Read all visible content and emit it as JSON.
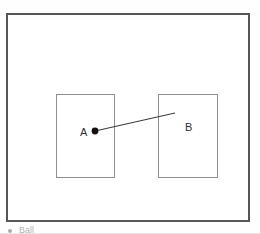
{
  "figure": {
    "frame": {
      "name": "figure-border",
      "color": "#55565a"
    },
    "boxes": [
      {
        "id": "A",
        "label": "A",
        "border_color": "#8d8f93"
      },
      {
        "id": "B",
        "label": "B",
        "border_color": "#8d8f93"
      }
    ],
    "contact_point": {
      "name": "contact-dot",
      "color": "#111111",
      "x": 95,
      "y": 131
    },
    "connector": {
      "name": "connector-line",
      "color": "#3c3d40",
      "from_x": 95,
      "from_y": 131,
      "to_x": 175,
      "to_y": 113
    }
  },
  "caption": {
    "bullet": "•",
    "text": "Ball"
  }
}
